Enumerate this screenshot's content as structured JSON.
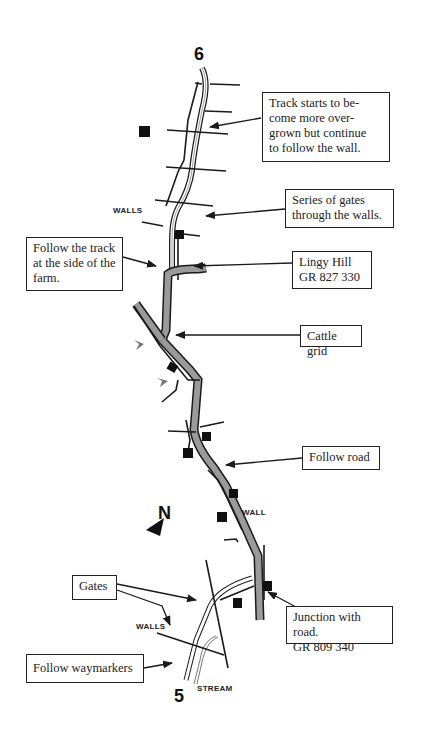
{
  "map": {
    "waypoints": {
      "start": "6",
      "end": "5"
    },
    "north_label": "N",
    "labels": {
      "walls_top": "WALLS",
      "wall_mid": "WALL",
      "walls_bottom": "WALLS",
      "stream": "STREAM"
    },
    "callouts": [
      {
        "id": "overgrown",
        "text": "Track starts to be-come more over-grown but continue to follow the wall.",
        "lines": [
          "Track starts to be-",
          "come more over-",
          "grown but continue",
          "to follow the wall."
        ]
      },
      {
        "id": "gates-walls",
        "lines": [
          "Series of gates",
          "through the walls."
        ]
      },
      {
        "id": "farm-track",
        "lines": [
          "Follow the track",
          "at the side of the",
          "farm."
        ]
      },
      {
        "id": "lingy-hill",
        "lines": [
          "Lingy Hill",
          "GR 827 330"
        ]
      },
      {
        "id": "cattle-grid",
        "lines": [
          "Cattle grid"
        ]
      },
      {
        "id": "follow-road",
        "lines": [
          "Follow road"
        ]
      },
      {
        "id": "gates",
        "lines": [
          "Gates"
        ]
      },
      {
        "id": "junction",
        "lines": [
          "Junction with road.",
          "GR 809 340"
        ]
      },
      {
        "id": "waymarkers",
        "lines": [
          "Follow waymarkers"
        ]
      }
    ],
    "colors": {
      "line": "#1a1a1a",
      "road_fill": "#9a9a9a",
      "marker": "#111111",
      "waymarker_arrow": "#777777"
    }
  }
}
